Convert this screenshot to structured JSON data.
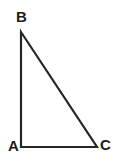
{
  "figure": {
    "type": "right-triangle-diagram",
    "background_color": "#ffffff",
    "stroke_color": "#262626",
    "stroke_width": 2.2,
    "canvas": {
      "width": 118,
      "height": 164
    },
    "vertices": [
      {
        "id": "B",
        "label": "B",
        "x": 21,
        "y": 32,
        "label_x": 16,
        "label_y": 9,
        "label_position": "above-right"
      },
      {
        "id": "A",
        "label": "A",
        "x": 21,
        "y": 147,
        "label_x": 8,
        "label_y": 138,
        "label_position": "left"
      },
      {
        "id": "C",
        "label": "C",
        "x": 97,
        "y": 147,
        "label_x": 100,
        "label_y": 137,
        "label_position": "right"
      }
    ],
    "edges": [
      {
        "id": "AB",
        "from": "A",
        "to": "B",
        "orientation": "vertical"
      },
      {
        "id": "AC",
        "from": "A",
        "to": "C",
        "orientation": "horizontal"
      },
      {
        "id": "BC",
        "from": "B",
        "to": "C",
        "orientation": "diagonal-hypotenuse"
      }
    ],
    "right_angle_at": "A",
    "label_color": "#1c1c1c",
    "label_font_size_px": 15,
    "label_font_weight": "bold"
  }
}
